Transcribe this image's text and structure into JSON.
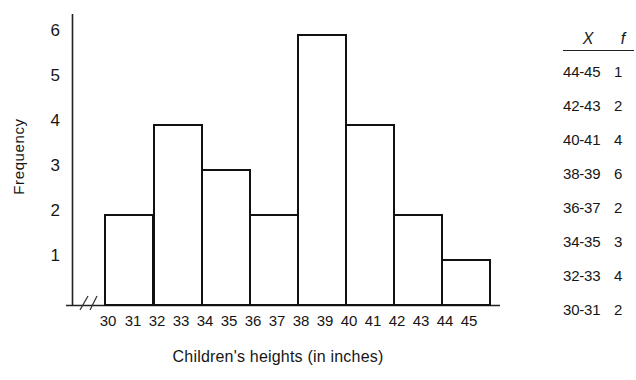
{
  "chart_data": {
    "type": "bar",
    "title": "",
    "xlabel": "Children's heights (in inches)",
    "ylabel": "Frequency",
    "categories": [
      "30-31",
      "32-33",
      "34-35",
      "36-37",
      "38-39",
      "40-41",
      "42-43",
      "44-45"
    ],
    "values": [
      2,
      4,
      3,
      2,
      6,
      4,
      2,
      1
    ],
    "x_tick_labels": [
      "30",
      "31",
      "32",
      "33",
      "34",
      "35",
      "36",
      "37",
      "38",
      "39",
      "40",
      "41",
      "42",
      "43",
      "44",
      "45"
    ],
    "y_tick_labels": [
      "6",
      "5",
      "4",
      "3",
      "2",
      "1"
    ],
    "y_tick_values": [
      6,
      5,
      4,
      3,
      2,
      1
    ],
    "xlim": [
      30,
      46
    ],
    "ylim": [
      0,
      6.4
    ],
    "grid": false,
    "legend": null,
    "axis_break": true,
    "bar_fill": "#ffffff",
    "bar_stroke": "#111111",
    "axis_color": "#222222"
  },
  "table": {
    "headers": [
      "X",
      "f"
    ],
    "rows": [
      {
        "x": "44-45",
        "f": "1"
      },
      {
        "x": "42-43",
        "f": "2"
      },
      {
        "x": "40-41",
        "f": "4"
      },
      {
        "x": "38-39",
        "f": "6"
      },
      {
        "x": "36-37",
        "f": "2"
      },
      {
        "x": "34-35",
        "f": "3"
      },
      {
        "x": "32-33",
        "f": "4"
      },
      {
        "x": "30-31",
        "f": "2"
      }
    ]
  }
}
